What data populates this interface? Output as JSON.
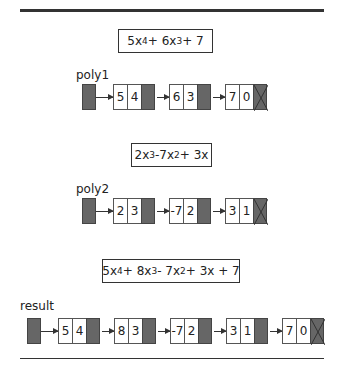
{
  "diagram": {
    "lists": [
      {
        "label": "poly1",
        "formula": "5x⁴ + 6x³ + 7",
        "formula_parts": [
          "5x",
          "4",
          " + 6x",
          "3",
          " + 7"
        ],
        "nodes": [
          {
            "coef": "5",
            "exp": "4"
          },
          {
            "coef": "6",
            "exp": "3"
          },
          {
            "coef": "7",
            "exp": "0",
            "null": true
          }
        ]
      },
      {
        "label": "poly2",
        "formula": "2x³ -7x² + 3x",
        "formula_parts": [
          "2x",
          "3",
          " -7x",
          "2",
          " + 3x"
        ],
        "nodes": [
          {
            "coef": "2",
            "exp": "3"
          },
          {
            "coef": "-7",
            "exp": "2"
          },
          {
            "coef": "3",
            "exp": "1",
            "null": true
          }
        ]
      },
      {
        "label": "result",
        "formula": "5x⁴ + 8x³ - 7x² + 3x + 7",
        "formula_parts": [
          "5x",
          "4",
          " + 8x",
          "3",
          " - 7x",
          "2",
          " + 3x + 7"
        ],
        "nodes": [
          {
            "coef": "5",
            "exp": "4"
          },
          {
            "coef": "8",
            "exp": "3"
          },
          {
            "coef": "-7",
            "exp": "2"
          },
          {
            "coef": "3",
            "exp": "1"
          },
          {
            "coef": "7",
            "exp": "0",
            "null": true
          }
        ]
      }
    ],
    "colors": {
      "pointer": "#666666",
      "line": "#333333"
    }
  }
}
